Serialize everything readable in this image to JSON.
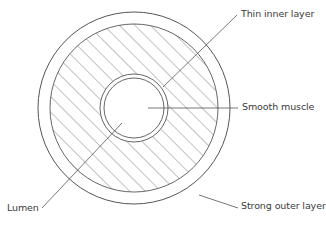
{
  "diagram": {
    "labels": {
      "thin_inner_layer": "Thin inner layer",
      "smooth_muscle": "Smooth muscle",
      "strong_outer_layer": "Strong outer layer",
      "lumen": "Lumen"
    },
    "colors": {
      "stroke": "#555555",
      "hatch": "#666666",
      "text": "#3a3a3a",
      "background": "#ffffff"
    }
  }
}
